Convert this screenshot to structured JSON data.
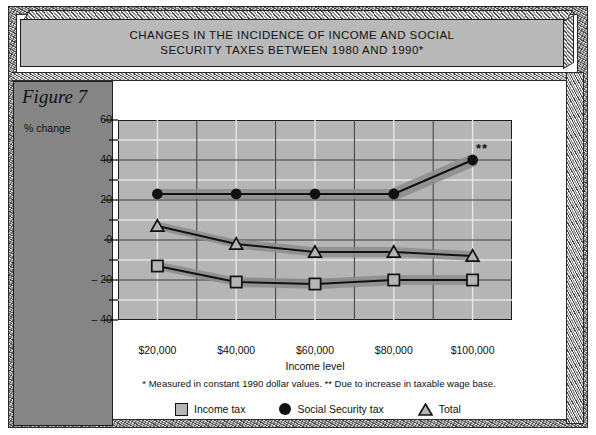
{
  "figure": {
    "label": "Figure 7",
    "title": "CHANGES IN THE INCIDENCE OF INCOME AND SOCIAL SECURITY TAXES BETWEEN 1980 AND 1990*",
    "title_line1": "CHANGES IN THE INCIDENCE OF INCOME AND SOCIAL",
    "title_line2": "SECURITY TAXES BETWEEN 1980 AND 1990*",
    "footnote": "* Measured in constant 1990 dollar values.  ** Due to increase in taxable wage base.",
    "annotation": "**"
  },
  "chart_data": {
    "type": "line",
    "title": "CHANGES IN THE INCIDENCE OF INCOME AND SOCIAL SECURITY TAXES BETWEEN 1980 AND 1990*",
    "xlabel": "Income level",
    "ylabel": "% change",
    "categories": [
      "$20,000",
      "$40,000",
      "$60,000",
      "$80,000",
      "$100,000"
    ],
    "x_values": [
      20000,
      40000,
      60000,
      80000,
      100000
    ],
    "ylim": [
      -40,
      60
    ],
    "yticks": [
      60,
      40,
      20,
      0,
      -20,
      -40
    ],
    "ytick_labels": [
      "60",
      "40",
      "20",
      "0",
      "– 20",
      "– 40"
    ],
    "y_minor_step": 10,
    "grid": true,
    "legend_position": "bottom",
    "series": [
      {
        "name": "Income tax",
        "marker": "square",
        "values": [
          -13,
          -21,
          -22,
          -20,
          -20
        ]
      },
      {
        "name": "Social Security tax",
        "marker": "circle-filled",
        "values": [
          23,
          23,
          23,
          23,
          40
        ]
      },
      {
        "name": "Total",
        "marker": "triangle",
        "values": [
          7,
          -2,
          -6,
          -6,
          -8
        ]
      }
    ],
    "annotations": [
      {
        "text": "**",
        "x": "$100,000",
        "y": 40,
        "note": "Due to increase in taxable wage base."
      }
    ]
  },
  "legend": {
    "items": [
      {
        "label": "Income tax",
        "icon": "square-marker"
      },
      {
        "label": "Social Security tax",
        "icon": "circle-marker"
      },
      {
        "label": "Total",
        "icon": "triangle-marker"
      }
    ]
  },
  "colors": {
    "plot_background": "#b5b5b5",
    "panel_background": "#858585",
    "banner_background": "#b9b9b9",
    "line": "#111111",
    "gridline_major": "#3a3a3a",
    "gridline_minor": "#e8e8e8",
    "shadow": "#8d8d8d",
    "page_background": "#ffffff"
  }
}
